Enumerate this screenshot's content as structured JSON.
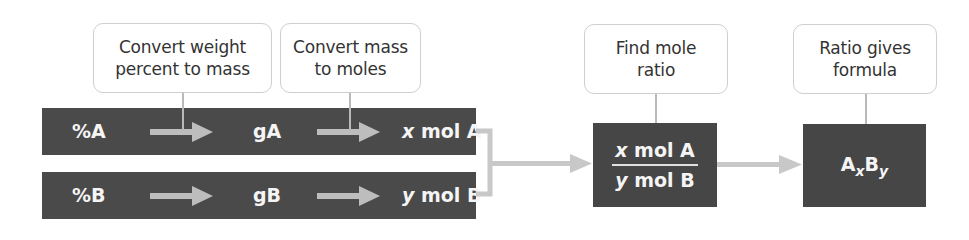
{
  "steps": [
    {
      "label_line1": "Convert weight",
      "label_line2": "percent to mass"
    },
    {
      "label_line1": "Convert mass",
      "label_line2": "to moles"
    },
    {
      "label_line1": "Find mole",
      "label_line2": "ratio"
    },
    {
      "label_line1": "Ratio gives",
      "label_line2": "formula"
    }
  ],
  "row_a": {
    "percent": "%A",
    "grams": "gA",
    "moles_var": "x",
    "moles_unit": "mol A"
  },
  "row_b": {
    "percent": "%B",
    "grams": "gB",
    "moles_var": "y",
    "moles_unit": "mol B"
  },
  "ratio_box": {
    "numerator_var": "x",
    "numerator_unit": "mol A",
    "denominator_var": "y",
    "denominator_unit": "mol B"
  },
  "formula_box": {
    "element_a": "A",
    "sub_a": "x",
    "element_b": "B",
    "sub_b": "y"
  },
  "colors": {
    "dark_box": "#4a4a4a",
    "arrow": "#bdbdbd",
    "label_border": "#cfcfcf",
    "text_light": "#f5f5f5"
  }
}
